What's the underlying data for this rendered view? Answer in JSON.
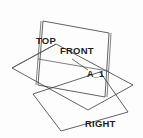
{
  "figure": {
    "background_color": "#fdfdfd",
    "line_color": "#3a3a3a",
    "text_color": "#1d1d1d",
    "width": 143,
    "height": 138
  },
  "labels": {
    "top": "TOP",
    "front": "FRONT",
    "right": "RIGHT",
    "point": "A_1"
  },
  "planes": [
    {
      "name": "top",
      "label": "TOP",
      "orientation": "horizontal",
      "points": "12,68 56,44 133,85 88,110"
    },
    {
      "name": "front",
      "label": "FRONT",
      "orientation": "frontal",
      "points": "42,22 109,34 104,96 37,84"
    },
    {
      "name": "right",
      "label": "RIGHT",
      "orientation": "profile",
      "points": "33,94 100,72 128,112 61,131"
    }
  ],
  "annotation": {
    "point_label": "A_1",
    "leader_from": "72,59",
    "leader_to": "89,70"
  }
}
